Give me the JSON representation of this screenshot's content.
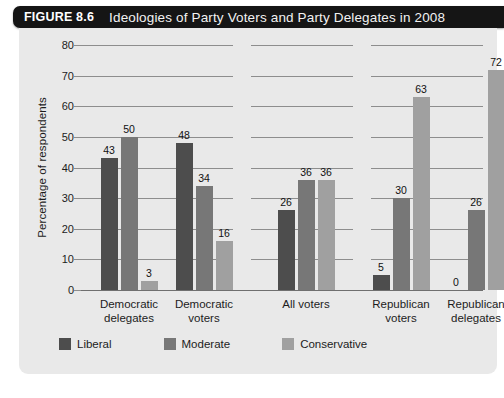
{
  "figure": {
    "number_label": "FIGURE 8.6",
    "title": "Ideologies of Party Voters and Party Delegates in 2008"
  },
  "colors": {
    "title_bar_bg": "#151515",
    "panel_bg": "#e9e9e9",
    "liberal": "#4d4d4d",
    "moderate": "#777777",
    "conservative": "#a0a0a0",
    "gridline": "#8d8d8d",
    "text": "#1c1c1c"
  },
  "chart_data": {
    "type": "bar",
    "title": "Ideologies of Party Voters and Party Delegates in 2008",
    "xlabel": "",
    "ylabel": "Percentage of respondents",
    "ylim": [
      0,
      80
    ],
    "yticks": [
      0,
      10,
      20,
      30,
      40,
      50,
      60,
      70,
      80
    ],
    "ytick_labels": [
      "0",
      "10",
      "20",
      "30",
      "40",
      "50",
      "60",
      "70",
      "80"
    ],
    "grid": true,
    "legend_position": "bottom-left",
    "categories": [
      "Democratic delegates",
      "Democratic voters",
      "All voters",
      "Republican voters",
      "Republican delegates"
    ],
    "category_lines": [
      [
        "Democratic",
        "delegates"
      ],
      [
        "Democratic",
        "voters"
      ],
      [
        "All voters"
      ],
      [
        "Republican",
        "voters"
      ],
      [
        "Republican",
        "delegates"
      ]
    ],
    "series": [
      {
        "name": "Liberal",
        "color": "#4d4d4d",
        "values": [
          43,
          48,
          26,
          5,
          0
        ]
      },
      {
        "name": "Moderate",
        "color": "#777777",
        "values": [
          50,
          34,
          36,
          30,
          26
        ]
      },
      {
        "name": "Conservative",
        "color": "#a0a0a0",
        "values": [
          3,
          16,
          36,
          63,
          72
        ]
      }
    ],
    "value_labels": [
      [
        "43",
        "50",
        "3"
      ],
      [
        "48",
        "34",
        "16"
      ],
      [
        "26",
        "36",
        "36"
      ],
      [
        "5",
        "30",
        "63"
      ],
      [
        "0",
        "26",
        "72"
      ]
    ]
  },
  "legend": {
    "items": [
      {
        "label": "Liberal",
        "key": "liberal"
      },
      {
        "label": "Moderate",
        "key": "moderate"
      },
      {
        "label": "Conservative",
        "key": "conservative"
      }
    ]
  }
}
